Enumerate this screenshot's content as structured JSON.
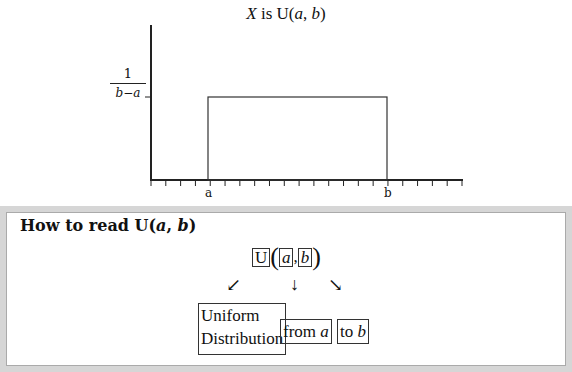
{
  "chart_data": {
    "type": "area",
    "title": "X is U(a, b)",
    "title_parts": {
      "var": "X",
      "is": " is ",
      "dist": "U(",
      "a": "a",
      "sep": ", ",
      "b": "b",
      "close": ")"
    },
    "ylabel_value": {
      "numerator": "1",
      "denominator": "b−a"
    },
    "x_tick_labels": [
      "a",
      "b"
    ],
    "x_tick_count": 22,
    "density": {
      "x_start": "a",
      "x_end": "b",
      "height": "1/(b−a)"
    },
    "grid": false,
    "legend": null
  },
  "panel": {
    "heading_prefix": "How to read U(",
    "heading_a": "a",
    "heading_sep": ", ",
    "heading_b": "b",
    "heading_close": ")",
    "expr": {
      "U": "U",
      "open": "(",
      "a": "a",
      "comma": ",",
      "b": "b",
      "close": ")"
    },
    "arrows": {
      "left": "↙",
      "down": "↓",
      "right": "↘"
    },
    "words": {
      "dist_line1": "Uniform",
      "dist_line2": "Distribution",
      "from_text": "from ",
      "from_var": "a",
      "to_text": "to ",
      "to_var": "b"
    }
  }
}
